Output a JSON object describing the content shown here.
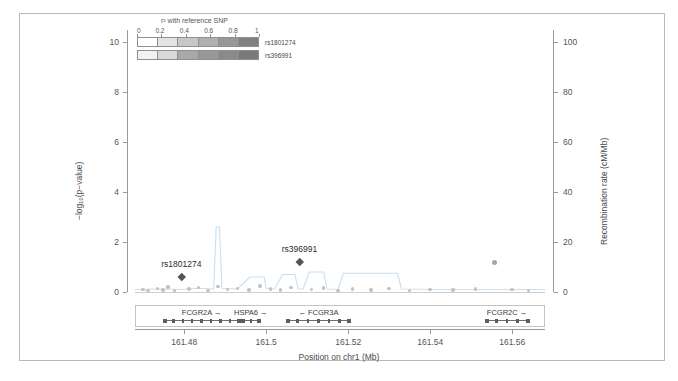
{
  "figure": {
    "type": "regional-association-plot",
    "background": "#ffffff",
    "border_color": "#b9b9b9"
  },
  "legend": {
    "title": "r² with reference SNP",
    "scale_ticks": [
      "0",
      "0.2",
      "0.4",
      "0.6",
      "0.8",
      "1"
    ],
    "rows": [
      {
        "label": "rs1801274",
        "colors": [
          "#ffffff",
          "#e3e3e3",
          "#c8c8c8",
          "#b0b0b0",
          "#989898",
          "#808080"
        ]
      },
      {
        "label": "rs396991",
        "colors": [
          "#f2f2f2",
          "#d8d8d8",
          "#a9a9a9",
          "#989898",
          "#8a8a8a",
          "#7a7a7a"
        ]
      }
    ]
  },
  "axes": {
    "left": {
      "title": "−log₁₀(p−value)",
      "ticks": [
        "0",
        "2",
        "4",
        "6",
        "8",
        "10"
      ],
      "min": 0,
      "max": 10.5
    },
    "right": {
      "title": "Recombination rate (cM/Mb)",
      "ticks": [
        "0",
        "20",
        "40",
        "60",
        "80",
        "100"
      ],
      "min": 0,
      "max": 105
    },
    "bottom": {
      "title": "Position on chr1 (Mb)",
      "ticks": [
        "161.48",
        "161.5",
        "161.52",
        "161.54",
        "161.56"
      ],
      "min": 161.468,
      "max": 161.568
    }
  },
  "snp_labels": [
    {
      "name": "rs1801274",
      "x": 161.4793,
      "y": 0.62
    },
    {
      "name": "rs396991",
      "x": 161.5081,
      "y": 1.22
    }
  ],
  "genes": [
    {
      "name": "FCGR2A",
      "strand": "+",
      "arrow": "→",
      "start": 161.4745,
      "end": 161.4935
    },
    {
      "name": "HSPA6",
      "strand": "+",
      "arrow": "→",
      "start": 161.4935,
      "end": 161.4985
    },
    {
      "name": "FCGR3A",
      "strand": "-",
      "arrow": "←",
      "start": 161.5045,
      "end": 161.5205
    },
    {
      "name": "FCGR2C",
      "strand": "+",
      "arrow": "→",
      "start": 161.553,
      "end": 161.564
    }
  ],
  "colors": {
    "recomb_line": "#c9dff0",
    "point_gray": "#9e9e9e",
    "diamond_dark": "#555555",
    "axis": "#9a9a9a",
    "text": "#4a4a4a"
  },
  "chart_data": {
    "type": "scatter",
    "title": "",
    "xlabel": "Position on chr1 (Mb)",
    "ylabel": "−log₁₀(p−value)",
    "y2label": "Recombination rate (cM/Mb)",
    "xlim": [
      161.468,
      161.568
    ],
    "ylim": [
      0,
      10.5
    ],
    "y2lim": [
      0,
      105
    ],
    "grid": false,
    "legend_position": "top-left",
    "xticks": [
      161.48,
      161.5,
      161.52,
      161.54,
      161.56
    ],
    "yticks": [
      0,
      2,
      4,
      6,
      8,
      10
    ],
    "y2ticks": [
      0,
      20,
      40,
      60,
      80,
      100
    ],
    "series": [
      {
        "name": "association points",
        "marker": "circle",
        "color": "#9e9e9e",
        "points": [
          {
            "x": 161.47,
            "y": 0.1
          },
          {
            "x": 161.4712,
            "y": 0.06
          },
          {
            "x": 161.4735,
            "y": 0.14
          },
          {
            "x": 161.4748,
            "y": 0.08
          },
          {
            "x": 161.476,
            "y": 0.2
          },
          {
            "x": 161.4776,
            "y": 0.05
          },
          {
            "x": 161.4812,
            "y": 0.12
          },
          {
            "x": 161.4835,
            "y": 0.18
          },
          {
            "x": 161.4858,
            "y": 0.07
          },
          {
            "x": 161.4882,
            "y": 0.22
          },
          {
            "x": 161.4905,
            "y": 0.11
          },
          {
            "x": 161.493,
            "y": 0.15
          },
          {
            "x": 161.4958,
            "y": 0.09
          },
          {
            "x": 161.4985,
            "y": 0.24
          },
          {
            "x": 161.501,
            "y": 0.13
          },
          {
            "x": 161.5035,
            "y": 0.08
          },
          {
            "x": 161.506,
            "y": 0.19
          },
          {
            "x": 161.511,
            "y": 0.1
          },
          {
            "x": 161.514,
            "y": 0.16
          },
          {
            "x": 161.5175,
            "y": 0.07
          },
          {
            "x": 161.521,
            "y": 0.12
          },
          {
            "x": 161.5255,
            "y": 0.09
          },
          {
            "x": 161.53,
            "y": 0.14
          },
          {
            "x": 161.535,
            "y": 0.06
          },
          {
            "x": 161.54,
            "y": 0.11
          },
          {
            "x": 161.5455,
            "y": 0.08
          },
          {
            "x": 161.551,
            "y": 0.13
          },
          {
            "x": 161.5556,
            "y": 1.2
          },
          {
            "x": 161.56,
            "y": 0.1
          },
          {
            "x": 161.564,
            "y": 0.07
          }
        ]
      },
      {
        "name": "labeled SNPs",
        "marker": "diamond",
        "color": "#555555",
        "points": [
          {
            "x": 161.4793,
            "y": 0.62,
            "label": "rs1801274"
          },
          {
            "x": 161.5081,
            "y": 1.22,
            "label": "rs396991"
          }
        ]
      },
      {
        "name": "recombination rate",
        "marker": "line",
        "axis": "right",
        "color": "#c9dff0",
        "points": [
          {
            "x": 161.468,
            "y": 1.0
          },
          {
            "x": 161.474,
            "y": 1.2
          },
          {
            "x": 161.479,
            "y": 1.0
          },
          {
            "x": 161.484,
            "y": 1.5
          },
          {
            "x": 161.4872,
            "y": 1.2
          },
          {
            "x": 161.4878,
            "y": 26.0
          },
          {
            "x": 161.4886,
            "y": 26.0
          },
          {
            "x": 161.4892,
            "y": 1.5
          },
          {
            "x": 161.493,
            "y": 1.2
          },
          {
            "x": 161.496,
            "y": 6.0
          },
          {
            "x": 161.4995,
            "y": 6.0
          },
          {
            "x": 161.5,
            "y": 1.5
          },
          {
            "x": 161.502,
            "y": 1.2
          },
          {
            "x": 161.504,
            "y": 7.0
          },
          {
            "x": 161.507,
            "y": 7.0
          },
          {
            "x": 161.5078,
            "y": 1.3
          },
          {
            "x": 161.509,
            "y": 1.2
          },
          {
            "x": 161.5105,
            "y": 8.0
          },
          {
            "x": 161.514,
            "y": 8.0
          },
          {
            "x": 161.5148,
            "y": 1.2
          },
          {
            "x": 161.5175,
            "y": 1.0
          },
          {
            "x": 161.5188,
            "y": 7.5
          },
          {
            "x": 161.532,
            "y": 7.5
          },
          {
            "x": 161.533,
            "y": 1.2
          },
          {
            "x": 161.542,
            "y": 1.0
          },
          {
            "x": 161.56,
            "y": 1.0
          },
          {
            "x": 161.568,
            "y": 1.0
          }
        ]
      }
    ]
  }
}
